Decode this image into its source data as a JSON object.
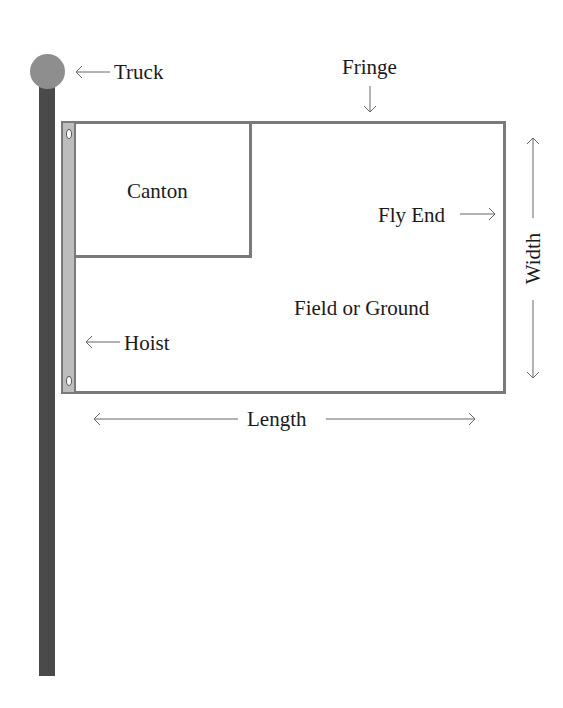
{
  "diagram": {
    "labels": {
      "truck": "Truck",
      "fringe": "Fringe",
      "canton": "Canton",
      "fly_end": "Fly End",
      "width": "Width",
      "field": "Field or Ground",
      "hoist": "Hoist",
      "length": "Length"
    },
    "colors": {
      "pole": "#4a4a4a",
      "truck_ball": "#8e8e8e",
      "hoist_strip": "#bdbdbd",
      "flag_border": "#7a7a7a",
      "arrow": "#666666",
      "text": "#1a1a1a"
    }
  }
}
